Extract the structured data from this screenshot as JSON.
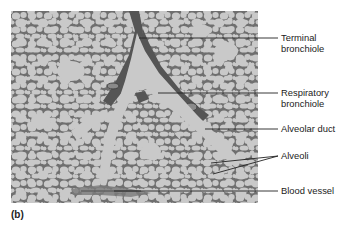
{
  "figure": {
    "panel_label": "(b)",
    "colors": {
      "airspace": "#c9c9c9",
      "tissue": "#6f6f6f",
      "tissue_dark": "#555555",
      "leader_line": "#222222",
      "text": "#222222"
    },
    "labels": [
      {
        "id": "terminal-bronchiole",
        "line1": "Terminal",
        "line2": "bronchiole"
      },
      {
        "id": "respiratory-bronchiole",
        "line1": "Respiratory",
        "line2": "bronchiole"
      },
      {
        "id": "alveolar-duct",
        "line1": "Alveolar duct"
      },
      {
        "id": "alveoli",
        "line1": "Alveoli"
      },
      {
        "id": "blood-vessel",
        "line1": "Blood vessel"
      }
    ]
  }
}
